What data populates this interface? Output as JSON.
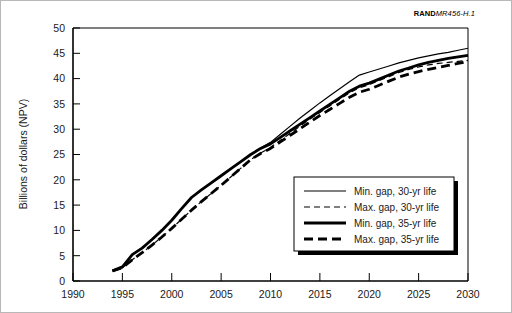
{
  "figure": {
    "id_prefix": "RAND",
    "id_suffix": "MR456-H.1"
  },
  "chart_data": {
    "type": "line",
    "title": "",
    "subtitle": "",
    "xlabel": "",
    "ylabel": "Billions of dollars (NPV)",
    "xlim": [
      1990,
      2030
    ],
    "ylim": [
      0,
      50
    ],
    "xticks": [
      1990,
      1995,
      2000,
      2005,
      2010,
      2015,
      2020,
      2025,
      2030
    ],
    "xtick_labels": [
      "1990",
      "1995",
      "2000",
      "2005",
      "2010",
      "2015",
      "2020",
      "2025",
      "2030"
    ],
    "yticks": [
      0,
      5,
      10,
      15,
      20,
      25,
      30,
      35,
      40,
      45,
      50
    ],
    "ytick_labels": [
      "0",
      "5",
      "10",
      "15",
      "20",
      "25",
      "30",
      "35",
      "40",
      "45",
      "50"
    ],
    "grid": false,
    "legend_position": "lower-right",
    "line_color": "#000000",
    "series": [
      {
        "name": "Min. gap, 30-yr life",
        "style": "thin-solid",
        "stroke_width": 1.2,
        "dash": "none",
        "x": [
          1994,
          1995,
          1996,
          1997,
          1998,
          1999,
          2000,
          2001,
          2002,
          2003,
          2004,
          2005,
          2006,
          2007,
          2008,
          2009,
          2010,
          2011,
          2012,
          2013,
          2014,
          2015,
          2016,
          2017,
          2018,
          2019,
          2020,
          2021,
          2022,
          2023,
          2024,
          2025,
          2026,
          2027,
          2028,
          2029,
          2030
        ],
        "y": [
          2.0,
          2.8,
          5.2,
          6.5,
          8.2,
          10.0,
          12.0,
          14.3,
          16.5,
          18.0,
          19.4,
          20.8,
          22.2,
          23.6,
          25.0,
          26.3,
          27.4,
          29.0,
          30.6,
          32.2,
          33.7,
          35.2,
          36.6,
          38.0,
          39.4,
          40.7,
          41.3,
          41.9,
          42.5,
          43.1,
          43.6,
          44.1,
          44.5,
          44.9,
          45.2,
          45.6,
          46.0
        ]
      },
      {
        "name": "Max. gap, 30-yr life",
        "style": "thin-dashed",
        "stroke_width": 1.2,
        "dash": "6,4",
        "x": [
          1994,
          1995,
          1996,
          1997,
          1998,
          1999,
          2000,
          2001,
          2002,
          2003,
          2004,
          2005,
          2006,
          2007,
          2008,
          2009,
          2010,
          2011,
          2012,
          2013,
          2014,
          2015,
          2016,
          2017,
          2018,
          2019,
          2020,
          2021,
          2022,
          2023,
          2024,
          2025,
          2026,
          2027,
          2028,
          2029,
          2030
        ],
        "y": [
          2.0,
          2.6,
          4.2,
          5.6,
          7.1,
          8.7,
          10.4,
          12.2,
          14.0,
          15.7,
          17.3,
          18.9,
          20.6,
          22.3,
          24.0,
          25.3,
          26.4,
          27.8,
          29.2,
          30.6,
          32.0,
          33.3,
          34.6,
          35.9,
          37.2,
          38.2,
          38.8,
          39.6,
          40.4,
          41.2,
          41.8,
          42.3,
          42.7,
          43.0,
          43.2,
          43.4,
          43.6
        ]
      },
      {
        "name": "Min. gap, 35-yr life",
        "style": "thick-solid",
        "stroke_width": 2.8,
        "dash": "none",
        "x": [
          1994,
          1995,
          1996,
          1997,
          1998,
          1999,
          2000,
          2001,
          2002,
          2003,
          2004,
          2005,
          2006,
          2007,
          2008,
          2009,
          2010,
          2011,
          2012,
          2013,
          2014,
          2015,
          2016,
          2017,
          2018,
          2019,
          2020,
          2021,
          2022,
          2023,
          2024,
          2025,
          2026,
          2027,
          2028,
          2029,
          2030
        ],
        "y": [
          2.0,
          2.8,
          5.2,
          6.5,
          8.2,
          10.0,
          12.0,
          14.3,
          16.5,
          18.0,
          19.4,
          20.8,
          22.2,
          23.6,
          25.0,
          26.2,
          27.1,
          28.4,
          29.7,
          31.0,
          32.3,
          33.6,
          34.9,
          36.2,
          37.5,
          38.5,
          39.1,
          39.9,
          40.7,
          41.5,
          42.1,
          42.7,
          43.2,
          43.6,
          44.0,
          44.3,
          44.6
        ]
      },
      {
        "name": "Max. gap, 35-yr life",
        "style": "thick-dashed",
        "stroke_width": 2.8,
        "dash": "9,5",
        "x": [
          1994,
          1995,
          1996,
          1997,
          1998,
          1999,
          2000,
          2001,
          2002,
          2003,
          2004,
          2005,
          2006,
          2007,
          2008,
          2009,
          2010,
          2011,
          2012,
          2013,
          2014,
          2015,
          2016,
          2017,
          2018,
          2019,
          2020,
          2021,
          2022,
          2023,
          2024,
          2025,
          2026,
          2027,
          2028,
          2029,
          2030
        ],
        "y": [
          2.0,
          2.6,
          4.2,
          5.6,
          7.1,
          8.7,
          10.4,
          12.2,
          14.0,
          15.7,
          17.3,
          18.9,
          20.6,
          22.3,
          24.0,
          25.2,
          26.2,
          27.5,
          28.8,
          30.1,
          31.4,
          32.7,
          33.9,
          35.1,
          36.3,
          37.3,
          37.9,
          38.7,
          39.5,
          40.3,
          40.9,
          41.4,
          41.8,
          42.2,
          42.6,
          43.0,
          43.4
        ]
      }
    ]
  },
  "legend": {
    "entries": [
      {
        "label": "Min. gap, 30-yr life"
      },
      {
        "label": "Max. gap, 30-yr life"
      },
      {
        "label": "Min. gap, 35-yr life"
      },
      {
        "label": "Max. gap, 35-yr life"
      }
    ]
  }
}
